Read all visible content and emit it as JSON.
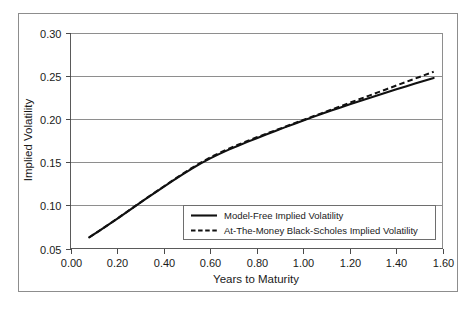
{
  "chart_data": {
    "type": "line",
    "title": "",
    "xlabel": "Years to Maturity",
    "ylabel": "Implied Volatility",
    "xlim": [
      0.0,
      1.6
    ],
    "ylim": [
      0.05,
      0.3
    ],
    "grid": "horizontal",
    "legend_position": "lower-right-inside",
    "xticks": [
      "0.00",
      "0.20",
      "0.40",
      "0.60",
      "0.80",
      "1.00",
      "1.20",
      "1.40",
      "1.60"
    ],
    "xtick_values": [
      0.0,
      0.2,
      0.4,
      0.6,
      0.8,
      1.0,
      1.2,
      1.4,
      1.6
    ],
    "yticks": [
      "0.05",
      "0.10",
      "0.15",
      "0.20",
      "0.25",
      "0.30"
    ],
    "ytick_values": [
      0.05,
      0.1,
      0.15,
      0.2,
      0.25,
      0.3
    ],
    "x": [
      0.08,
      0.12,
      0.16,
      0.2,
      0.24,
      0.28,
      0.32,
      0.36,
      0.4,
      0.44,
      0.48,
      0.52,
      0.56,
      0.6,
      0.64,
      0.68,
      0.72,
      0.76,
      0.8,
      0.84,
      0.88,
      0.92,
      0.96,
      1.0,
      1.04,
      1.08,
      1.12,
      1.16,
      1.2,
      1.24,
      1.28,
      1.32,
      1.36,
      1.4,
      1.44,
      1.48,
      1.52,
      1.56
    ],
    "series": [
      {
        "name": "Model-Free Implied Volatility",
        "style": "solid",
        "color": "#111111",
        "values": [
          0.063,
          0.07,
          0.0772,
          0.0845,
          0.092,
          0.0995,
          0.107,
          0.1143,
          0.1215,
          0.1288,
          0.1358,
          0.1425,
          0.1487,
          0.1545,
          0.1598,
          0.1647,
          0.1693,
          0.1737,
          0.178,
          0.1822,
          0.1864,
          0.1905,
          0.1945,
          0.1985,
          0.2024,
          0.2062,
          0.21,
          0.2137,
          0.2173,
          0.2209,
          0.2244,
          0.2279,
          0.2313,
          0.2347,
          0.238,
          0.2413,
          0.2446,
          0.2478
        ]
      },
      {
        "name": "At-The-Money Black-Scholes Implied Volatility",
        "style": "dashed",
        "color": "#111111",
        "values": [
          0.0628,
          0.0699,
          0.0771,
          0.0845,
          0.0921,
          0.0997,
          0.1072,
          0.1146,
          0.1219,
          0.1292,
          0.1363,
          0.1432,
          0.1496,
          0.1556,
          0.161,
          0.1659,
          0.1705,
          0.1748,
          0.179,
          0.1831,
          0.1871,
          0.1911,
          0.1951,
          0.1991,
          0.2031,
          0.2071,
          0.2111,
          0.2151,
          0.2191,
          0.2231,
          0.2271,
          0.2311,
          0.2351,
          0.2391,
          0.2431,
          0.2471,
          0.2511,
          0.2551
        ]
      }
    ],
    "legend_entries": [
      {
        "label": "Model-Free Implied Volatility",
        "style": "solid"
      },
      {
        "label": "At-The-Money Black-Scholes Implied Volatility",
        "style": "dashed"
      }
    ]
  }
}
